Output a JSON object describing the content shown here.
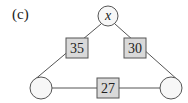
{
  "figure": {
    "label": "(c)",
    "top_node": {
      "text": "x"
    },
    "bottom_left_node": {
      "text": ""
    },
    "bottom_right_node": {
      "text": ""
    },
    "edges": [
      {
        "from": "top",
        "to": "bottom_left",
        "value": "35"
      },
      {
        "from": "top",
        "to": "bottom_right",
        "value": "30"
      },
      {
        "from": "bottom_left",
        "to": "bottom_right",
        "value": "27"
      }
    ],
    "colors": {
      "box_fill": "#d9d9d9",
      "stroke": "#555555",
      "circle_fill": "#f7f7f7"
    }
  }
}
